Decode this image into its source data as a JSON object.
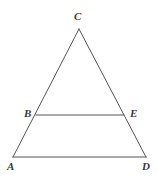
{
  "figure": {
    "kind": "geometry-diagram",
    "background_color": "#ffffff",
    "stroke_color": "#555555",
    "label_color": "#3a3a3a",
    "stroke_width": 1,
    "canvas": {
      "width": 158,
      "height": 180
    },
    "points": {
      "A": {
        "label": "A",
        "x": 13,
        "y": 157,
        "label_x": 7,
        "label_y": 161
      },
      "B": {
        "label": "B",
        "x": 36,
        "y": 115,
        "label_x": 24,
        "label_y": 108
      },
      "C": {
        "label": "C",
        "x": 79,
        "y": 29,
        "label_x": 74,
        "label_y": 11
      },
      "D": {
        "label": "D",
        "x": 146,
        "y": 157,
        "label_x": 142,
        "label_y": 161
      },
      "E": {
        "label": "E",
        "x": 124,
        "y": 115,
        "label_x": 130,
        "label_y": 108
      }
    },
    "segments": [
      {
        "name": "side-AC",
        "from": "A",
        "to": "C",
        "x1": 13,
        "y1": 157,
        "x2": 79,
        "y2": 29
      },
      {
        "name": "side-CD",
        "from": "C",
        "to": "D",
        "x1": 79,
        "y1": 29,
        "x2": 146,
        "y2": 157
      },
      {
        "name": "base-AD",
        "from": "A",
        "to": "D",
        "x1": 13,
        "y1": 157,
        "x2": 146,
        "y2": 157
      },
      {
        "name": "segment-BE",
        "from": "B",
        "to": "E",
        "x1": 36,
        "y1": 115,
        "x2": 124,
        "y2": 115
      }
    ]
  }
}
